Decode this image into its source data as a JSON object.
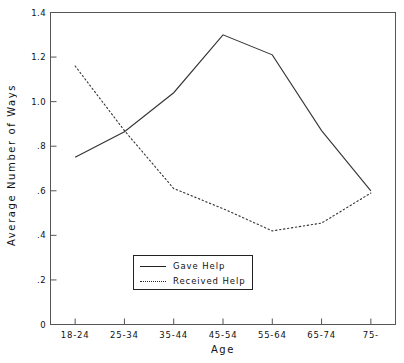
{
  "chart_data": {
    "type": "line",
    "title": "",
    "xlabel": "Age",
    "ylabel": "Average Number of Ways",
    "categories": [
      "18-24",
      "25-34",
      "35-44",
      "45-54",
      "55-64",
      "65-74",
      "75-"
    ],
    "series": [
      {
        "name": "Gave Help",
        "style": "solid",
        "values": [
          0.75,
          0.865,
          1.04,
          1.3,
          1.21,
          0.87,
          0.6
        ]
      },
      {
        "name": "Received Help",
        "style": "dotted",
        "values": [
          1.16,
          0.87,
          0.61,
          0.52,
          0.42,
          0.455,
          0.59
        ]
      }
    ],
    "ylim": [
      0,
      1.4
    ],
    "yticks": [
      0,
      0.2,
      0.4,
      0.6,
      0.8,
      1.0,
      1.2,
      1.4
    ],
    "ytick_labels": [
      "0",
      ".2",
      ".4",
      ".6",
      ".8",
      "1.0",
      "1.2",
      "1.4"
    ],
    "grid": false,
    "legend_position": "bottom-center",
    "line_color": "#222222"
  },
  "legend": {
    "entries": [
      {
        "label": "Gave Help",
        "style": "solid"
      },
      {
        "label": "Received Help",
        "style": "dotted"
      }
    ]
  }
}
